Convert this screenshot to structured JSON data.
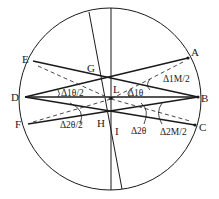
{
  "diagram": {
    "type": "geometry-circle-chords",
    "points": {
      "A": "A",
      "B": "B",
      "C": "C",
      "D": "D",
      "E": "E",
      "F": "F",
      "G": "G",
      "H": "H",
      "I": "I",
      "L": "L"
    },
    "angle_labels": {
      "d1_theta_half": "Δ1θ/2",
      "d1_theta": "Δ1θ",
      "d1_M_half": "Δ1M/2",
      "d2_theta_half": "Δ2θ/2",
      "d2_theta": "Δ2θ",
      "d2_M_half": "Δ2M/2"
    },
    "colors": {
      "line": "#1a1a1a",
      "horizontal_axis": "#555555",
      "dashed": "#333333",
      "background": "#ffffff"
    }
  }
}
